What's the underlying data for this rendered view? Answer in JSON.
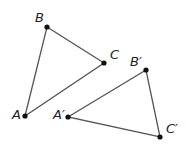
{
  "diagram": {
    "title": "",
    "triangles": [
      {
        "name": "ABC",
        "points": [
          {
            "label": "A",
            "x": 25,
            "y": 116,
            "lx": 12,
            "ly": 119
          },
          {
            "label": "B",
            "x": 47,
            "y": 27,
            "lx": 35,
            "ly": 22
          },
          {
            "label": "C",
            "x": 104,
            "y": 63,
            "lx": 110,
            "ly": 59
          }
        ]
      },
      {
        "name": "A'B'C'",
        "points": [
          {
            "label": "A′",
            "x": 68,
            "y": 117,
            "lx": 53,
            "ly": 119
          },
          {
            "label": "B′",
            "x": 146,
            "y": 70,
            "lx": 130,
            "ly": 66
          },
          {
            "label": "C′",
            "x": 160,
            "y": 137,
            "lx": 166,
            "ly": 133
          }
        ]
      }
    ],
    "colors": {
      "line": "#555555",
      "point": "#111111",
      "label": "#222222"
    }
  }
}
